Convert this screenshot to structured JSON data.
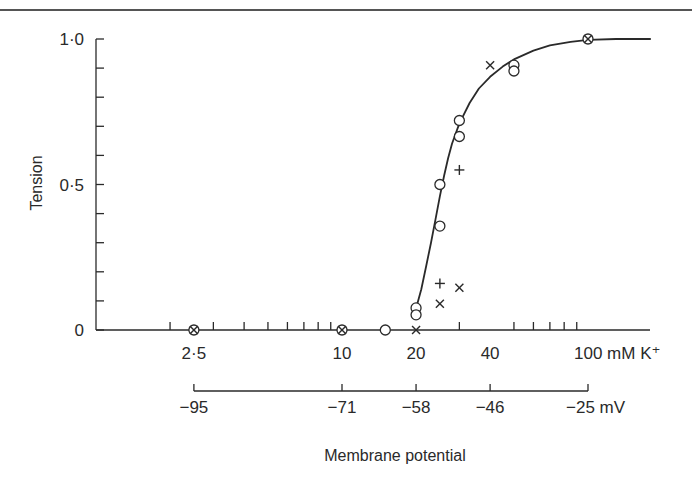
{
  "chart_data": {
    "type": "scatter",
    "title": "",
    "xlabel": "mM K+",
    "ylabel": "Tension",
    "x_scale": "log",
    "xlim": [
      1.5,
      250
    ],
    "ylim": [
      0,
      1.0
    ],
    "grid": false,
    "legend": null,
    "x_tick_labels": [
      {
        "value": 2.5,
        "label": "2·5"
      },
      {
        "value": 10,
        "label": "10"
      },
      {
        "value": 20,
        "label": "20"
      },
      {
        "value": 40,
        "label": "40"
      },
      {
        "value": 100,
        "label": "100 mM K⁺"
      }
    ],
    "x_minor_ticks": [
      2,
      3,
      4,
      5,
      6,
      7,
      8,
      9,
      30,
      50,
      60,
      70,
      80,
      90
    ],
    "y_tick_labels": [
      {
        "value": 0,
        "label": "0"
      },
      {
        "value": 0.5,
        "label": "0·5"
      },
      {
        "value": 1.0,
        "label": "1·0"
      }
    ],
    "y_minor_ticks": [
      0.1,
      0.2,
      0.3,
      0.4,
      0.6,
      0.7,
      0.8,
      0.9
    ],
    "secondary_x_axis": {
      "label": "Membrane potential",
      "unit": "mV",
      "ticks": [
        {
          "k": 2.5,
          "label": "−95"
        },
        {
          "k": 10,
          "label": "−71"
        },
        {
          "k": 20,
          "label": "−58"
        },
        {
          "k": 40,
          "label": "−46"
        },
        {
          "k": 100,
          "label": "−25 mV"
        }
      ]
    },
    "series": [
      {
        "name": "circles",
        "marker": "circle",
        "points": [
          [
            2.5,
            0.0
          ],
          [
            10,
            0.0
          ],
          [
            15,
            0.0
          ],
          [
            20,
            0.076
          ],
          [
            20,
            0.052
          ],
          [
            25,
            0.5
          ],
          [
            25,
            0.357
          ],
          [
            30,
            0.72
          ],
          [
            30,
            0.665
          ],
          [
            50,
            0.91
          ],
          [
            50,
            0.89
          ],
          [
            100,
            1.0
          ]
        ]
      },
      {
        "name": "plus",
        "marker": "plus",
        "points": [
          [
            25,
            0.16
          ],
          [
            30,
            0.55
          ]
        ]
      },
      {
        "name": "cross",
        "marker": "x",
        "points": [
          [
            2.5,
            0.0
          ],
          [
            10,
            0.0
          ],
          [
            20,
            0.0
          ],
          [
            25,
            0.09
          ],
          [
            30,
            0.145
          ],
          [
            40,
            0.91
          ],
          [
            100,
            1.0
          ]
        ]
      }
    ],
    "fitted_curve": {
      "name": "sigmoid fit",
      "points": [
        [
          20,
          0.075
        ],
        [
          21,
          0.14
        ],
        [
          22,
          0.22
        ],
        [
          23,
          0.3
        ],
        [
          24,
          0.38
        ],
        [
          25,
          0.46
        ],
        [
          26,
          0.53
        ],
        [
          27,
          0.59
        ],
        [
          28,
          0.64
        ],
        [
          30,
          0.71
        ],
        [
          33,
          0.78
        ],
        [
          36,
          0.83
        ],
        [
          40,
          0.87
        ],
        [
          45,
          0.905
        ],
        [
          50,
          0.93
        ],
        [
          60,
          0.96
        ],
        [
          70,
          0.978
        ],
        [
          85,
          0.99
        ],
        [
          100,
          0.997
        ],
        [
          130,
          1.0
        ],
        [
          180,
          1.0
        ]
      ]
    }
  },
  "labels": {
    "ylabel": "Tension",
    "secondary_axis_title": "Membrane potential"
  },
  "colors": {
    "ink": "#2a2a2a",
    "background": "#ffffff"
  }
}
